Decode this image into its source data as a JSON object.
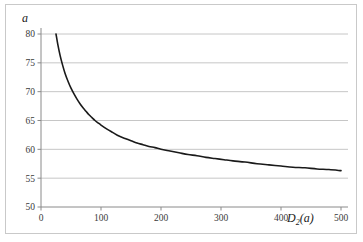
{
  "figure": {
    "background_color": "#ffffff",
    "frame_color": "#c9c9c9",
    "plot_background_color": "#ffffff"
  },
  "axis": {
    "y_title": "a",
    "x_title_main": "D",
    "x_title_sub": "2",
    "x_title_arg": "(a)",
    "x_title_full": "D2(a)"
  },
  "chart_data": {
    "type": "line",
    "title": "",
    "xlabel": "D2(a)",
    "ylabel": "a",
    "xlim": [
      0,
      500
    ],
    "ylim": [
      50,
      80
    ],
    "xticks": [
      0,
      100,
      200,
      300,
      400,
      500
    ],
    "yticks": [
      50,
      55,
      60,
      65,
      70,
      75,
      80
    ],
    "xtick_labels": [
      "0",
      "100",
      "200",
      "300",
      "400",
      "500"
    ],
    "ytick_labels": [
      "50",
      "55",
      "60",
      "65",
      "70",
      "75",
      "80"
    ],
    "grid": "horizontal",
    "grid_color": "#c0c0c0",
    "legend": "none",
    "series": [
      {
        "name": "a",
        "color": "#1a1a1a",
        "line_width": 1.6,
        "x": [
          25,
          28,
          32,
          36,
          40,
          45,
          50,
          55,
          60,
          65,
          70,
          75,
          80,
          85,
          90,
          95,
          100,
          110,
          120,
          130,
          140,
          150,
          160,
          170,
          180,
          190,
          200,
          215,
          230,
          245,
          260,
          275,
          290,
          305,
          320,
          340,
          360,
          380,
          400,
          420,
          440,
          460,
          480,
          500
        ],
        "y": [
          80.0,
          78.2,
          76.2,
          74.6,
          73.2,
          71.8,
          70.6,
          69.6,
          68.7,
          67.9,
          67.2,
          66.6,
          66.0,
          65.5,
          65.0,
          64.6,
          64.2,
          63.5,
          62.9,
          62.3,
          61.9,
          61.5,
          61.1,
          60.8,
          60.5,
          60.3,
          60.0,
          59.7,
          59.4,
          59.1,
          58.9,
          58.6,
          58.4,
          58.2,
          58.0,
          57.8,
          57.5,
          57.3,
          57.1,
          56.9,
          56.8,
          56.6,
          56.5,
          56.3
        ]
      }
    ]
  }
}
